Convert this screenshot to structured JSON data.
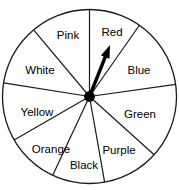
{
  "figure": {
    "kind": "spinner-wheel"
  },
  "chart_data": {
    "type": "pie",
    "title": "",
    "xlabel": "",
    "ylabel": "",
    "legend": "none",
    "grid": false,
    "note": "Nine-sector spinner; pointer is resting in the Red sector.",
    "categories": [
      "Red",
      "Blue",
      "Green",
      "Purple",
      "Black",
      "Orange",
      "Yellow",
      "White",
      "Pink"
    ],
    "values": [
      35,
      47,
      50,
      38,
      35,
      35,
      39,
      41,
      40
    ],
    "units": "degrees",
    "sectors": [
      {
        "label": "Red",
        "start_angle": 55,
        "end_angle": 90,
        "fill": "#ffffff",
        "label_x": 112,
        "label_y": 33
      },
      {
        "label": "Blue",
        "start_angle": 8,
        "end_angle": 55,
        "fill": "#ffffff",
        "label_x": 139,
        "label_y": 71
      },
      {
        "label": "Green",
        "start_angle": -42,
        "end_angle": 8,
        "fill": "#ffffff",
        "label_x": 140,
        "label_y": 115
      },
      {
        "label": "Purple",
        "start_angle": -80,
        "end_angle": -42,
        "fill": "#ffffff",
        "label_x": 119,
        "label_y": 151
      },
      {
        "label": "Black",
        "start_angle": -115,
        "end_angle": -80,
        "fill": "#ffffff",
        "label_x": 84,
        "label_y": 166
      },
      {
        "label": "Orange",
        "start_angle": -150,
        "end_angle": -115,
        "fill": "#ffffff",
        "label_x": 51,
        "label_y": 150
      },
      {
        "label": "Yellow",
        "start_angle": 171,
        "end_angle": -150,
        "fill": "#ffffff",
        "label_x": 37,
        "label_y": 113
      },
      {
        "label": "White",
        "start_angle": 130,
        "end_angle": 171,
        "fill": "#ffffff",
        "label_x": 40,
        "label_y": 71
      },
      {
        "label": "Pink",
        "start_angle": 90,
        "end_angle": 130,
        "fill": "#ffffff",
        "label_x": 68,
        "label_y": 36
      }
    ],
    "pointer": {
      "label": "pointer-arrow",
      "angle_deg": 70,
      "points_to": "Red",
      "tip_x": 110,
      "tip_y": 45
    },
    "geometry": {
      "center_x": 89.5,
      "center_y": 96.5,
      "radius": 87
    },
    "colors": {
      "outline": "#1a1a1a",
      "sector_fill": "#ffffff",
      "pointer": "#000000",
      "label_text": "#000000",
      "background": "#ffffff"
    }
  }
}
